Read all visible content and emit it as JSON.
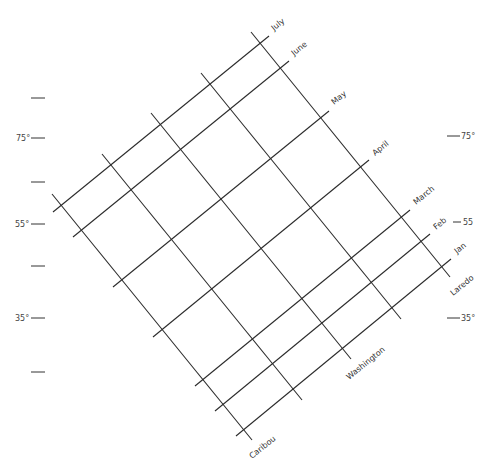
{
  "diagram": {
    "title": "",
    "month_labels": [
      {
        "name": "July",
        "x": 276,
        "y": 28
      },
      {
        "name": "June",
        "x": 295,
        "y": 55
      },
      {
        "name": "May",
        "x": 335,
        "y": 104
      },
      {
        "name": "April",
        "x": 376,
        "y": 155
      },
      {
        "name": "March",
        "x": 416,
        "y": 204
      },
      {
        "name": "Feb",
        "x": 435,
        "y": 230
      },
      {
        "name": "Jan",
        "x": 455,
        "y": 254
      }
    ],
    "location_labels": [
      {
        "name": "Caribou",
        "x": 252,
        "y": 462
      },
      {
        "name": "Washington",
        "x": 350,
        "y": 380
      },
      {
        "name": "Laredo",
        "x": 454,
        "y": 296
      }
    ],
    "left_axis": {
      "ticks": [
        {
          "y": 98,
          "label": ""
        },
        {
          "y": 138,
          "label": "75°"
        },
        {
          "y": 182,
          "label": ""
        },
        {
          "y": 224,
          "label": "55°"
        },
        {
          "y": 266,
          "label": ""
        },
        {
          "y": 318,
          "label": "35°"
        },
        {
          "y": 372,
          "label": ""
        }
      ]
    },
    "right_axis": {
      "ticks": [
        {
          "y": 136,
          "label": "75°"
        },
        {
          "y": 222,
          "label": "55"
        },
        {
          "y": 318,
          "label": "35°"
        }
      ]
    },
    "grid": {
      "month_lines": [
        "July",
        "June",
        "May",
        "April",
        "March",
        "Feb",
        "Jan"
      ],
      "location_lines": [
        "Caribou",
        "",
        "Washington",
        "",
        "Laredo"
      ]
    }
  }
}
